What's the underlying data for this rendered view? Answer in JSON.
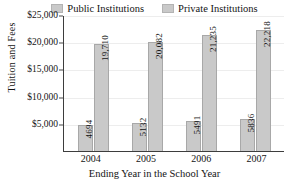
{
  "chart_data": {
    "type": "bar",
    "title": "",
    "xlabel": "Ending Year in the School Year",
    "ylabel": "Tuition and Fees",
    "categories": [
      "2004",
      "2005",
      "2006",
      "2007"
    ],
    "series": [
      {
        "name": "Public Institutions",
        "values": [
          4694,
          5132,
          5491,
          5836
        ]
      },
      {
        "name": "Private Institutions",
        "values": [
          19710,
          20082,
          21235,
          22218
        ]
      }
    ],
    "value_labels": {
      "public": [
        "4694",
        "5132",
        "5491",
        "5836"
      ],
      "private": [
        "19,710",
        "20,082",
        "21,235",
        "22,218"
      ]
    },
    "ylim": [
      0,
      25000
    ],
    "yticks": [
      5000,
      10000,
      15000,
      20000,
      25000
    ],
    "ytick_labels": [
      "$5,000",
      "$10,000",
      "$15,000",
      "$20,000",
      "$25,000"
    ],
    "grid": true,
    "legend_position": "top",
    "colors": {
      "public_bar": "#c9c9c9",
      "private_bar": "#c9c9c9",
      "bar_border": "#a8a8a8",
      "axis": "#3d3d3d",
      "gridline": "#ededed",
      "text": "#141414",
      "background": "#ffffff"
    }
  },
  "legend": {
    "items": [
      {
        "label": "Public Institutions"
      },
      {
        "label": "Private Institutions"
      }
    ]
  },
  "axes": {
    "y_title": "Tuition and Fees",
    "x_title": "Ending Year in the School Year"
  }
}
